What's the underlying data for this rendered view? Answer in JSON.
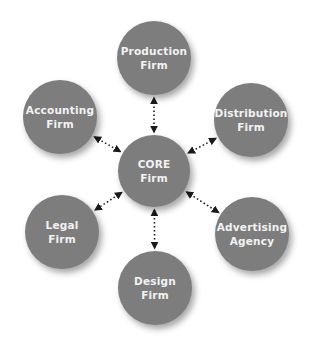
{
  "diagram": {
    "type": "hub-and-spoke",
    "colors": {
      "node_fill": "#7d7d7d",
      "node_text": "#f2f2f2",
      "connector": "#1a1a1a",
      "background": "#ffffff"
    },
    "center": {
      "line1": "CORE",
      "line2": "Firm",
      "cx": 154,
      "cy": 171,
      "r": 36
    },
    "nodes": [
      {
        "id": "production",
        "line1": "Production",
        "line2": "Firm",
        "cx": 154,
        "cy": 58,
        "r": 37
      },
      {
        "id": "distribution",
        "line1": "Distribution",
        "line2": "Firm",
        "cx": 251,
        "cy": 120,
        "r": 37
      },
      {
        "id": "advertising",
        "line1": "Advertising",
        "line2": "Agency",
        "cx": 252,
        "cy": 234,
        "r": 37
      },
      {
        "id": "design",
        "line1": "Design",
        "line2": "Firm",
        "cx": 155,
        "cy": 288,
        "r": 37
      },
      {
        "id": "legal",
        "line1": "Legal",
        "line2": "Firm",
        "cx": 62,
        "cy": 232,
        "r": 37
      },
      {
        "id": "accounting",
        "line1": "Accounting",
        "line2": "Firm",
        "cx": 60,
        "cy": 117,
        "r": 37
      }
    ],
    "connectors": [
      {
        "from": "core",
        "to": "production",
        "style": "dotted",
        "arrows": "both"
      },
      {
        "from": "core",
        "to": "distribution",
        "style": "dotted",
        "arrows": "both"
      },
      {
        "from": "core",
        "to": "advertising",
        "style": "dotted",
        "arrows": "both"
      },
      {
        "from": "core",
        "to": "design",
        "style": "dotted",
        "arrows": "both"
      },
      {
        "from": "core",
        "to": "legal",
        "style": "dotted",
        "arrows": "both"
      },
      {
        "from": "core",
        "to": "accounting",
        "style": "dotted",
        "arrows": "both"
      }
    ]
  }
}
